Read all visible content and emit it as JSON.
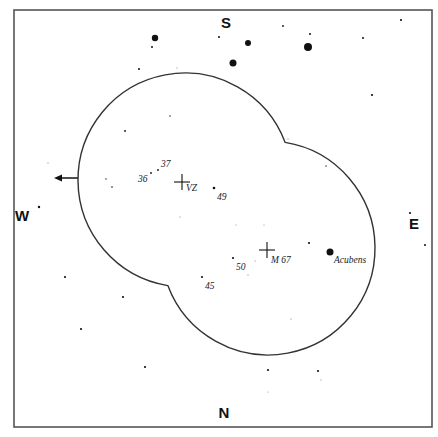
{
  "chart": {
    "frame": {
      "x": 14,
      "y": 10,
      "width": 418,
      "height": 417,
      "stroke": "#555555"
    },
    "directions": {
      "south": {
        "label": "S",
        "x": 226,
        "y": 28
      },
      "north": {
        "label": "N",
        "x": 224,
        "y": 418
      },
      "west": {
        "label": "W",
        "x": 22,
        "y": 221
      },
      "east": {
        "label": "E",
        "x": 414,
        "y": 229
      }
    },
    "field_outline": {
      "stroke": "#333333",
      "circles": [
        {
          "name": "upper-left-field",
          "cx": 185,
          "cy": 180,
          "r": 107
        },
        {
          "name": "lower-right-field",
          "cx": 268,
          "cy": 248,
          "r": 107
        }
      ]
    },
    "direction_arrow": {
      "x1": 78,
      "y1": 178,
      "x2": 54,
      "y2": 178,
      "meaning": "westward drift"
    },
    "markers": [
      {
        "name": "VZ",
        "label": "VZ",
        "x": 182,
        "y": 182,
        "label_dx": 4,
        "label_dy": 9
      },
      {
        "name": "M 67",
        "label": "M 67",
        "x": 267,
        "y": 250,
        "label_dx": 4,
        "label_dy": 13
      }
    ],
    "labeled_stars": [
      {
        "label": "Acubens",
        "x": 330,
        "y": 252,
        "r": 3.5,
        "label_x": 334,
        "label_y": 263
      },
      {
        "label": "36",
        "x": 151,
        "y": 173,
        "r": 0.9,
        "label_x": 138,
        "label_y": 182
      },
      {
        "label": "37",
        "x": 158,
        "y": 170,
        "r": 0.9,
        "label_x": 161,
        "label_y": 167
      },
      {
        "label": "49",
        "x": 214,
        "y": 188,
        "r": 1.3,
        "label_x": 217,
        "label_y": 200
      },
      {
        "label": "50",
        "x": 233,
        "y": 258,
        "r": 1.1,
        "label_x": 236,
        "label_y": 270
      },
      {
        "label": "45",
        "x": 202,
        "y": 277,
        "r": 1.1,
        "label_x": 205,
        "label_y": 289
      }
    ],
    "stars": [
      {
        "x": 155,
        "y": 38,
        "r": 3.2
      },
      {
        "x": 152,
        "y": 47,
        "r": 1
      },
      {
        "x": 139,
        "y": 69,
        "r": 1
      },
      {
        "x": 177,
        "y": 68,
        "r": 0.6
      },
      {
        "x": 219,
        "y": 37,
        "r": 1
      },
      {
        "x": 248,
        "y": 43,
        "r": 3
      },
      {
        "x": 233,
        "y": 63,
        "r": 3.5
      },
      {
        "x": 283,
        "y": 26,
        "r": 0.9
      },
      {
        "x": 310,
        "y": 34,
        "r": 1
      },
      {
        "x": 308,
        "y": 47,
        "r": 4
      },
      {
        "x": 363,
        "y": 38,
        "r": 1
      },
      {
        "x": 401,
        "y": 20,
        "r": 1.1
      },
      {
        "x": 372,
        "y": 95,
        "r": 1.1
      },
      {
        "x": 288,
        "y": 139,
        "r": 0.6
      },
      {
        "x": 326,
        "y": 166,
        "r": 0.7
      },
      {
        "x": 170,
        "y": 116,
        "r": 0.7
      },
      {
        "x": 125,
        "y": 131,
        "r": 0.9
      },
      {
        "x": 48,
        "y": 163,
        "r": 0.6
      },
      {
        "x": 106,
        "y": 179,
        "r": 0.7
      },
      {
        "x": 112,
        "y": 187,
        "r": 0.8
      },
      {
        "x": 39,
        "y": 207,
        "r": 1.2
      },
      {
        "x": 180,
        "y": 217,
        "r": 0.6
      },
      {
        "x": 410,
        "y": 213,
        "r": 1.1
      },
      {
        "x": 425,
        "y": 245,
        "r": 1
      },
      {
        "x": 236,
        "y": 225,
        "r": 0.5
      },
      {
        "x": 264,
        "y": 225,
        "r": 0.5
      },
      {
        "x": 309,
        "y": 243,
        "r": 1.1
      },
      {
        "x": 255,
        "y": 261,
        "r": 0.6
      },
      {
        "x": 248,
        "y": 275,
        "r": 0.6
      },
      {
        "x": 291,
        "y": 319,
        "r": 0.6
      },
      {
        "x": 65,
        "y": 277,
        "r": 1.1
      },
      {
        "x": 123,
        "y": 297,
        "r": 1.1
      },
      {
        "x": 81,
        "y": 329,
        "r": 1.1
      },
      {
        "x": 145,
        "y": 367,
        "r": 1.1
      },
      {
        "x": 268,
        "y": 370,
        "r": 1.1
      },
      {
        "x": 318,
        "y": 371,
        "r": 1.1
      },
      {
        "x": 321,
        "y": 380,
        "r": 0.6
      },
      {
        "x": 268,
        "y": 392,
        "r": 0.5
      }
    ]
  }
}
